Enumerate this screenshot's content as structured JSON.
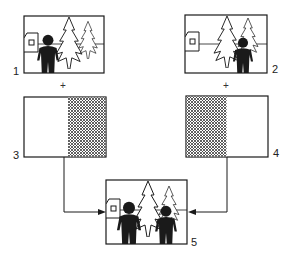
{
  "diagram": {
    "frames": [
      {
        "id": 1,
        "label": "1",
        "content": "scene with house, trees, and large man on left"
      },
      {
        "id": 2,
        "label": "2",
        "content": "scene with house, trees, and smaller man on right"
      },
      {
        "id": 3,
        "label": "3",
        "content": "matte: left half clear, right half hatched"
      },
      {
        "id": 4,
        "label": "4",
        "content": "matte: left half hatched, right half clear"
      },
      {
        "id": 5,
        "label": "5",
        "content": "composite: both men in one scene"
      }
    ],
    "operators": {
      "plus_left": "+",
      "plus_right": "+"
    },
    "colors": {
      "ink": "#1a1a1a",
      "paper": "#ffffff",
      "hatch": "#333333"
    }
  }
}
